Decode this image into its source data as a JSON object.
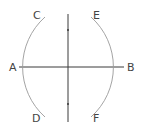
{
  "diagram": {
    "type": "perpendicular-bisector-construction",
    "labels": {
      "A": "A",
      "B": "B",
      "C": "C",
      "D": "D",
      "E": "E",
      "F": "F"
    },
    "colors": {
      "line": "#3a3a3a",
      "arc": "#9a9a9a",
      "text": "#444444",
      "background": "#ffffff"
    }
  }
}
